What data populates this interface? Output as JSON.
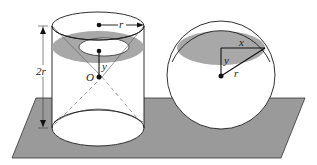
{
  "figure": {
    "colors": {
      "plane": "#9a9a9a",
      "shaded_section": "#a8a8a8",
      "stroke": "#1a1a1a",
      "dashed": "#8a8a8a",
      "background": "#ffffff"
    }
  },
  "cylinder": {
    "labels": {
      "radius": "r",
      "height": "2r",
      "center": "O",
      "distance": "y"
    }
  },
  "sphere": {
    "labels": {
      "cross_section_radius": "x",
      "distance": "y",
      "radius": "r"
    }
  }
}
